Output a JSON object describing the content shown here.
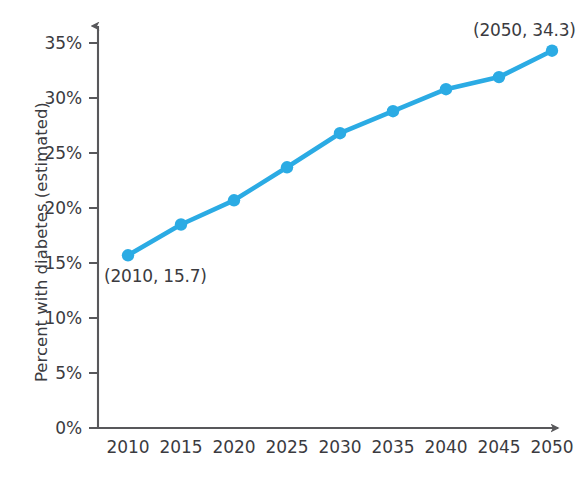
{
  "chart_data": {
    "type": "line",
    "title": "",
    "xlabel": "",
    "ylabel": "Percent with diabetes (estimated)",
    "x": [
      2010,
      2015,
      2020,
      2025,
      2030,
      2035,
      2040,
      2045,
      2050
    ],
    "values": [
      15.7,
      18.5,
      20.7,
      23.7,
      26.8,
      28.8,
      30.8,
      31.9,
      34.3
    ],
    "xtick_labels": [
      "2010",
      "2015",
      "2020",
      "2025",
      "2030",
      "2035",
      "2040",
      "2045",
      "2050"
    ],
    "ytick_labels": [
      "0%",
      "5%",
      "10%",
      "15%",
      "20%",
      "25%",
      "30%",
      "35%"
    ],
    "ytick_values": [
      0,
      5,
      10,
      15,
      20,
      25,
      30,
      35
    ],
    "xlim": [
      2010,
      2050
    ],
    "ylim": [
      0,
      35
    ],
    "grid": false,
    "legend": null,
    "series_color": "#2babe4",
    "axis_color": "#58585b",
    "text_color": "#3b3b3f",
    "annotations": [
      {
        "label": "(2010, 15.7)",
        "x": 2010,
        "y": 15.7,
        "position": "below-right"
      },
      {
        "label": "(2050, 34.3)",
        "x": 2050,
        "y": 34.3,
        "position": "above-left"
      }
    ]
  }
}
